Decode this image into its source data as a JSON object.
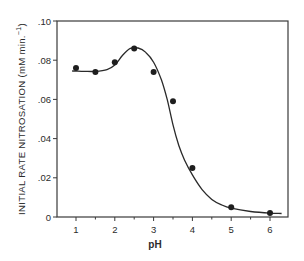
{
  "chart_data": {
    "type": "scatter",
    "title": "",
    "xlabel": "pH",
    "ylabel": "INITIAL RATE NITROSATION (mM min.⁻¹)",
    "xlim": [
      0.5,
      6.5
    ],
    "ylim": [
      0,
      0.1
    ],
    "grid": false,
    "legend": null,
    "x_ticks": [
      1,
      2,
      3,
      4,
      5,
      6
    ],
    "x_tick_labels": [
      "1",
      "2",
      "3",
      "4",
      "5",
      "6"
    ],
    "x_minor_ticks": [
      1.5,
      2.5,
      3.5,
      4.5,
      5.5
    ],
    "y_ticks": [
      0,
      0.02,
      0.04,
      0.06,
      0.08,
      0.1
    ],
    "y_tick_labels": [
      "0",
      ".02",
      ".04",
      ".06",
      ".08",
      ".10"
    ],
    "series": [
      {
        "name": "measured",
        "kind": "points",
        "x": [
          1,
          1.5,
          2,
          2.5,
          3,
          3.5,
          4,
          5,
          6
        ],
        "y": [
          0.076,
          0.074,
          0.079,
          0.086,
          0.074,
          0.059,
          0.025,
          0.005,
          0.002
        ]
      },
      {
        "name": "fitted curve",
        "kind": "line",
        "x": [
          0.9,
          1.2,
          1.5,
          1.8,
          2.0,
          2.2,
          2.4,
          2.6,
          2.8,
          3.0,
          3.2,
          3.35,
          3.5,
          3.65,
          3.8,
          4.0,
          4.25,
          4.5,
          4.75,
          5.0,
          5.5,
          6.0,
          6.3
        ],
        "y": [
          0.0745,
          0.0743,
          0.0743,
          0.0752,
          0.0775,
          0.0825,
          0.086,
          0.0862,
          0.084,
          0.079,
          0.07,
          0.06,
          0.047,
          0.0365,
          0.029,
          0.0215,
          0.014,
          0.009,
          0.0062,
          0.0045,
          0.0028,
          0.002,
          0.0018
        ]
      }
    ]
  },
  "axes": {
    "x_title": "pH",
    "y_title": "INITIAL RATE NITROSATION (mM min.",
    "y_title_superscript": "−1",
    "y_title_close": ")"
  }
}
